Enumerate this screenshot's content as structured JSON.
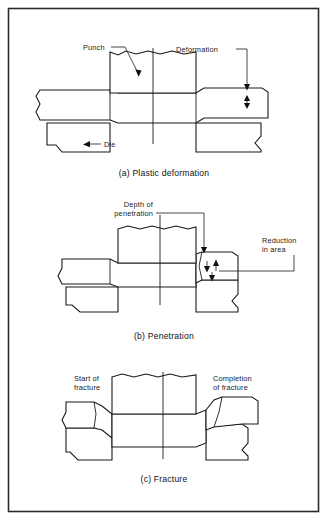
{
  "figure": {
    "border_color": "#2b2b2b",
    "line_color": "#1a1a1a",
    "hatch_color": "#2a2a2a",
    "background": "#ffffff"
  },
  "panels": [
    {
      "id": "a",
      "caption": "(a) Plastic deformation",
      "labels": [
        {
          "key": "punch",
          "text": "Punch"
        },
        {
          "key": "deformation",
          "text": "Deformation"
        },
        {
          "key": "die",
          "text": "Die"
        }
      ]
    },
    {
      "id": "b",
      "caption": "(b) Penetration",
      "labels": [
        {
          "key": "depth",
          "line1": "Depth of",
          "line2": "penetration"
        },
        {
          "key": "reduction",
          "line1": "Reduction",
          "line2": "in area"
        }
      ]
    },
    {
      "id": "c",
      "caption": "(c) Fracture",
      "labels": [
        {
          "key": "start",
          "line1": "Start of",
          "line2": "fracture"
        },
        {
          "key": "completion",
          "line1": "Completion",
          "line2": "of fracture"
        }
      ]
    }
  ]
}
